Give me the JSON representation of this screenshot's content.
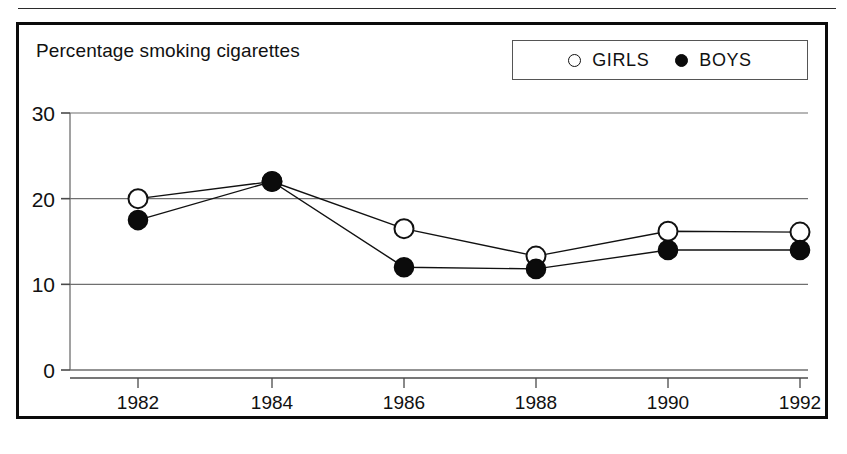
{
  "chart": {
    "title": "Percentage smoking cigarettes",
    "frame_color": "#0b0b0b",
    "background": "#ffffff"
  },
  "legend": {
    "entries": [
      {
        "label": "GIRLS",
        "marker": "open-circle",
        "color": "#ffffff",
        "stroke": "#111111"
      },
      {
        "label": "BOYS",
        "marker": "filled-circle",
        "color": "#0b0b0b",
        "stroke": "#0b0b0b"
      }
    ]
  },
  "chart_data": {
    "type": "line",
    "title": "Percentage smoking cigarettes",
    "xlabel": "",
    "ylabel": "",
    "x": [
      1982,
      1984,
      1986,
      1988,
      1990,
      1992
    ],
    "categories": [
      "1982",
      "1984",
      "1986",
      "1988",
      "1990",
      "1992"
    ],
    "xtick_labels": [
      "1982",
      "1984",
      "1986",
      "1988",
      "1990",
      "1992"
    ],
    "ytick_labels": [
      "0",
      "10",
      "20",
      "30"
    ],
    "yticks": [
      0,
      10,
      20,
      30
    ],
    "ylim": [
      0,
      30
    ],
    "grid": "horizontal",
    "legend_position": "top-right",
    "series": [
      {
        "name": "GIRLS",
        "marker": "open-circle",
        "color": "#ffffff",
        "stroke": "#111111",
        "values": [
          20.0,
          22.0,
          16.5,
          13.3,
          16.2,
          16.1
        ]
      },
      {
        "name": "BOYS",
        "marker": "filled-circle",
        "color": "#0b0b0b",
        "stroke": "#0b0b0b",
        "values": [
          17.5,
          22.0,
          12.0,
          11.8,
          14.0,
          14.0
        ]
      }
    ]
  }
}
